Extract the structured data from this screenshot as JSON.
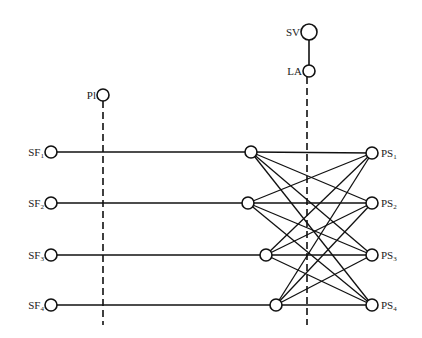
{
  "diagram": {
    "type": "network",
    "nodes": [
      {
        "id": "SV",
        "label": "SV",
        "sub": "",
        "x": 309,
        "y": 32,
        "r": 8,
        "label_side": "left"
      },
      {
        "id": "LA",
        "label": "LA",
        "sub": "",
        "x": 309,
        "y": 71,
        "r": 6,
        "label_side": "left"
      },
      {
        "id": "Pl",
        "label": "Pl",
        "sub": "",
        "x": 103,
        "y": 95,
        "r": 6,
        "label_side": "left"
      },
      {
        "id": "SF1",
        "label": "SF",
        "sub": "1",
        "x": 51,
        "y": 152,
        "r": 6,
        "label_side": "left"
      },
      {
        "id": "SF2",
        "label": "SF",
        "sub": "2",
        "x": 51,
        "y": 203,
        "r": 6,
        "label_side": "left"
      },
      {
        "id": "SF3",
        "label": "SF",
        "sub": "3",
        "x": 51,
        "y": 255,
        "r": 6,
        "label_side": "left"
      },
      {
        "id": "SF4",
        "label": "SF",
        "sub": "4",
        "x": 51,
        "y": 305,
        "r": 6,
        "label_side": "left"
      },
      {
        "id": "M1",
        "label": "",
        "sub": "",
        "x": 251,
        "y": 152,
        "r": 6,
        "label_side": "none"
      },
      {
        "id": "M2",
        "label": "",
        "sub": "",
        "x": 248,
        "y": 203,
        "r": 6,
        "label_side": "none"
      },
      {
        "id": "M3",
        "label": "",
        "sub": "",
        "x": 266,
        "y": 255,
        "r": 6,
        "label_side": "none"
      },
      {
        "id": "M4",
        "label": "",
        "sub": "",
        "x": 276,
        "y": 305,
        "r": 6,
        "label_side": "none"
      },
      {
        "id": "PS1",
        "label": "PS",
        "sub": "1",
        "x": 372,
        "y": 153,
        "r": 6,
        "label_side": "right"
      },
      {
        "id": "PS2",
        "label": "PS",
        "sub": "2",
        "x": 372,
        "y": 203,
        "r": 6,
        "label_side": "right"
      },
      {
        "id": "PS3",
        "label": "PS",
        "sub": "3",
        "x": 372,
        "y": 255,
        "r": 6,
        "label_side": "right"
      },
      {
        "id": "PS4",
        "label": "PS",
        "sub": "4",
        "x": 372,
        "y": 305,
        "r": 6,
        "label_side": "right"
      }
    ],
    "solid_links": [
      [
        "SV",
        "LA"
      ]
    ],
    "dashed_lines": [
      {
        "from_node": "Pl",
        "x": 103,
        "y_end": 325
      },
      {
        "from_node": "LA",
        "x": 307,
        "y_end": 325
      }
    ],
    "edges": [
      [
        "SF1",
        "M1"
      ],
      [
        "SF2",
        "M2"
      ],
      [
        "SF3",
        "M3"
      ],
      [
        "SF4",
        "M4"
      ],
      [
        "M1",
        "PS1"
      ],
      [
        "M1",
        "PS2"
      ],
      [
        "M1",
        "PS3"
      ],
      [
        "M1",
        "PS4"
      ],
      [
        "M2",
        "PS1"
      ],
      [
        "M2",
        "PS2"
      ],
      [
        "M2",
        "PS3"
      ],
      [
        "M2",
        "PS4"
      ],
      [
        "M3",
        "PS1"
      ],
      [
        "M3",
        "PS2"
      ],
      [
        "M3",
        "PS3"
      ],
      [
        "M3",
        "PS4"
      ],
      [
        "M4",
        "PS1"
      ],
      [
        "M4",
        "PS2"
      ],
      [
        "M4",
        "PS3"
      ],
      [
        "M4",
        "PS4"
      ]
    ]
  }
}
